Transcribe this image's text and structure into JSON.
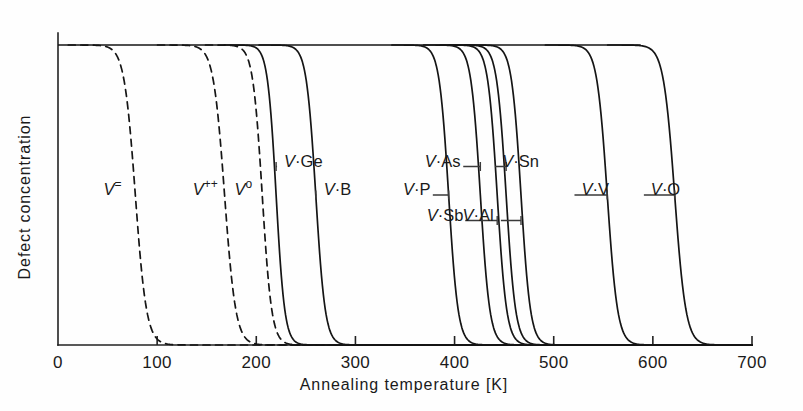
{
  "chart_data": {
    "type": "line",
    "title": "",
    "xlabel": "Annealing temperature  [K]",
    "ylabel": "Defect concentration",
    "xlim": [
      0,
      700
    ],
    "ylim": [
      0,
      1
    ],
    "grid": false,
    "legend_position": "inline-labels",
    "xticks": [
      0,
      100,
      200,
      300,
      400,
      500,
      600,
      700
    ],
    "xtick_labels": [
      "0",
      "100",
      "200",
      "300",
      "400",
      "500",
      "600",
      "700"
    ],
    "yticks": [],
    "ytick_labels": [],
    "series": [
      {
        "name": "V=",
        "label_html": "V<sup>=</sup>",
        "midpoint_K": 78,
        "width_K": 26,
        "style": "dashed",
        "label_x_K": 46,
        "label_y_frac": 0.5,
        "leader": "none"
      },
      {
        "name": "V++",
        "label_html": "V<sup>++</sup>",
        "midpoint_K": 168,
        "width_K": 26,
        "style": "dashed",
        "label_x_K": 136,
        "label_y_frac": 0.5,
        "leader": "none"
      },
      {
        "name": "V0",
        "label_html": "V<sup>o</sup>",
        "midpoint_K": 206,
        "width_K": 22,
        "style": "dashed",
        "label_x_K": 178,
        "label_y_frac": 0.5,
        "leader": "none"
      },
      {
        "name": "V.Ge",
        "label_html": "V·Ge",
        "midpoint_K": 220,
        "width_K": 20,
        "style": "solid",
        "label_x_K": 228,
        "label_y_frac": 0.405,
        "leader": "left"
      },
      {
        "name": "V.B",
        "label_html": "V·B",
        "midpoint_K": 260,
        "width_K": 22,
        "style": "solid",
        "label_x_K": 268,
        "label_y_frac": 0.5,
        "leader": "left"
      },
      {
        "name": "V.P",
        "label_html": "V·P",
        "midpoint_K": 394,
        "width_K": 22,
        "style": "solid",
        "label_x_K": 348,
        "label_y_frac": 0.5,
        "leader": "right"
      },
      {
        "name": "V.As",
        "label_html": "V·As",
        "midpoint_K": 426,
        "width_K": 22,
        "style": "solid",
        "label_x_K": 370,
        "label_y_frac": 0.405,
        "leader": "right"
      },
      {
        "name": "V.Sb",
        "label_html": "V·Sb",
        "midpoint_K": 443,
        "width_K": 22,
        "style": "solid",
        "label_x_K": 372,
        "label_y_frac": 0.585,
        "leader": "right-long"
      },
      {
        "name": "V.Sn",
        "label_html": "V·Sn",
        "midpoint_K": 452,
        "width_K": 22,
        "style": "solid",
        "label_x_K": 448,
        "label_y_frac": 0.405,
        "leader": "left"
      },
      {
        "name": "V.Al",
        "label_html": "V·Al",
        "midpoint_K": 467,
        "width_K": 22,
        "style": "solid",
        "label_x_K": 408,
        "label_y_frac": 0.585,
        "leader": "right"
      },
      {
        "name": "V.V",
        "label_html": "V·V",
        "midpoint_K": 554,
        "width_K": 24,
        "style": "solid",
        "label_x_K": 528,
        "label_y_frac": 0.5,
        "leader": "left"
      },
      {
        "name": "V.O",
        "label_html": "V·O",
        "midpoint_K": 622,
        "width_K": 26,
        "style": "solid",
        "label_x_K": 598,
        "label_y_frac": 0.5,
        "leader": "left"
      }
    ]
  },
  "axes": {
    "x_title": "Annealing temperature  [K]",
    "y_title": "Defect concentration"
  },
  "labels": {
    "t0": "0",
    "t100": "100",
    "t200": "200",
    "t300": "300",
    "t400": "400",
    "t500": "500",
    "t600": "600",
    "t700": "700"
  },
  "colors": {
    "ink": "#151515",
    "axis": "#222222",
    "background": "#fefefe",
    "leader": "#3a3a3a"
  }
}
